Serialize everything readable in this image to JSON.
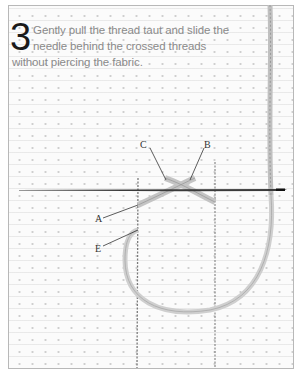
{
  "instruction": {
    "step_number": "3",
    "text": "Gently pull the thread taut and slide the needle behind the crossed threads without piercing the fabric."
  },
  "labels": {
    "a": "A",
    "b": "B",
    "c": "C",
    "e": "E"
  },
  "colors": {
    "frame_border": "#b8b8b8",
    "fabric": "#fbfbfb",
    "thread": "#c8c8c8",
    "needle": "#3a3a3a",
    "text": "#8a8a8a",
    "step_number": "#1a1a1a"
  }
}
